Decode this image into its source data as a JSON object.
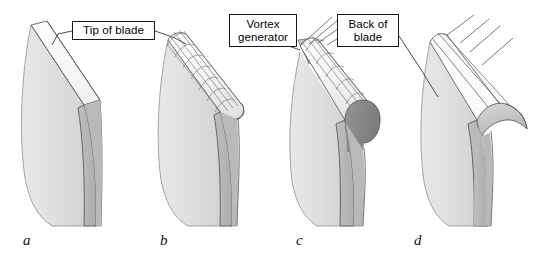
{
  "figure": {
    "width": 546,
    "height": 261,
    "background": "#ffffff"
  },
  "callouts": [
    {
      "id": "tip-of-blade",
      "text": "Tip of blade",
      "target_panel": "a"
    },
    {
      "id": "vortex-generator",
      "text": "Vortex\ngenerator",
      "target_panel": "c"
    },
    {
      "id": "back-of-blade",
      "text": "Back of\nblade",
      "target_panel": "d"
    }
  ],
  "panels": [
    {
      "id": "a",
      "label": "a",
      "description": "plain blade with flat tip"
    },
    {
      "id": "b",
      "label": "b",
      "description": "blade tip with mesh grid"
    },
    {
      "id": "c",
      "label": "c",
      "description": "blade tip with triangular vortex generator fins and rounded dark cap"
    },
    {
      "id": "d",
      "label": "d",
      "description": "blade with curved hooked winglet tip"
    }
  ],
  "colors": {
    "face_light": "#e2e2e0",
    "face_lighter": "#ededeb",
    "face_mid": "#d2d2d0",
    "side_gray": "#b7b7b5",
    "side_gray_dark": "#a9a9a7",
    "cap_dark": "#8a8a88",
    "tip_white": "#fafafa",
    "stroke": "#4a4a4a",
    "stroke_dark": "#2b2b2b",
    "text": "#000000",
    "background": "#ffffff"
  }
}
